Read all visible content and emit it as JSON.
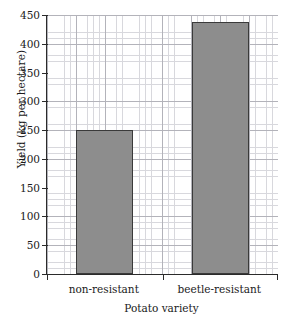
{
  "chart_data": {
    "type": "bar",
    "title": "",
    "subtitle": "",
    "xlabel": "Potato variety",
    "ylabel": "Yield (kg per hectare)",
    "categories": [
      "non-resistant",
      "beetle-resistant"
    ],
    "values": [
      250,
      437
    ],
    "series": [
      {
        "name": "Yield",
        "values": [
          250,
          437
        ]
      }
    ],
    "ylim": [
      0,
      450
    ],
    "yticks": [
      0,
      50,
      100,
      150,
      200,
      250,
      300,
      350,
      400,
      450
    ],
    "ytick_labels": [
      "0",
      "50",
      "100",
      "150",
      "200",
      "250",
      "300",
      "350",
      "400",
      "450"
    ],
    "grid": true,
    "grid_style": "fine graph paper, minor and major lines",
    "legend": false,
    "legend_position": "none",
    "bar_color": "#8d8d8d",
    "bar_border_color": "#3a3a3a",
    "axis_color": "#2b2b2b",
    "background_color": "#ffffff",
    "annotations": []
  },
  "axes": {
    "y_title": "Yield (kg per hectare)",
    "x_title": "Potato variety"
  }
}
